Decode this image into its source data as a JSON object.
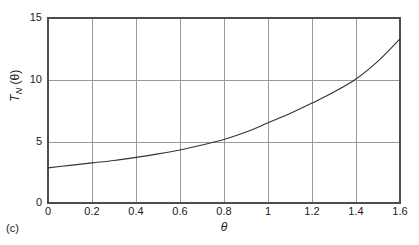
{
  "panel": {
    "label": "(c)"
  },
  "axis": {
    "x_label": "θ",
    "y_label_main": "T",
    "y_label_sub": "N",
    "y_label_arg": " (θ)"
  },
  "ticks": {
    "x": [
      "0",
      "0.2",
      "0.4",
      "0.6",
      "0.8",
      "1",
      "1.2",
      "1.4",
      "1.6"
    ],
    "y": [
      "0",
      "5",
      "10",
      "15"
    ]
  },
  "colors": {
    "axis": "#4d4d4d",
    "grid": "#9a9a9a",
    "curve": "#333333",
    "background": "#ffffff",
    "text": "#1a1a1a"
  },
  "chart_data": {
    "type": "line",
    "title": "",
    "subtitle": "",
    "xlabel": "θ",
    "ylabel": "T_N(θ)",
    "xlim": [
      0,
      1.6
    ],
    "ylim": [
      0,
      15
    ],
    "xticks": [
      0,
      0.2,
      0.4,
      0.6,
      0.8,
      1,
      1.2,
      1.4,
      1.6
    ],
    "yticks": [
      0,
      5,
      10,
      15
    ],
    "grid": true,
    "legend": null,
    "legend_position": "none",
    "annotations": [
      "(c)"
    ],
    "series": [
      {
        "name": "T_N(θ)",
        "x": [
          0,
          0.1,
          0.2,
          0.3,
          0.4,
          0.5,
          0.6,
          0.7,
          0.8,
          0.9,
          1.0,
          1.1,
          1.2,
          1.3,
          1.4,
          1.5,
          1.6
        ],
        "values": [
          2.85,
          3.05,
          3.25,
          3.45,
          3.7,
          3.98,
          4.3,
          4.7,
          5.15,
          5.75,
          6.5,
          7.25,
          8.1,
          9.0,
          10.05,
          11.5,
          13.3
        ]
      }
    ]
  }
}
